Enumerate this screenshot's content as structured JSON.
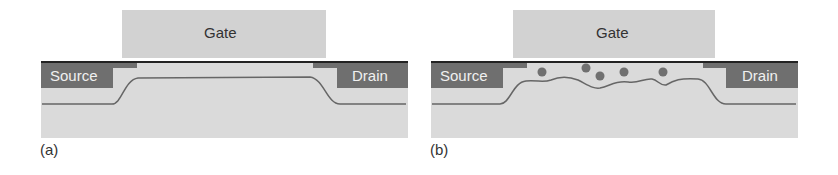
{
  "panels": [
    {
      "id": "a",
      "caption": "(a)",
      "gate": "Gate",
      "source": "Source",
      "drain": "Drain"
    },
    {
      "id": "b",
      "caption": "(b)",
      "gate": "Gate",
      "source": "Source",
      "drain": "Drain"
    }
  ],
  "colors": {
    "gate": "#d2d2d2",
    "substrate": "#d9d9d9",
    "contact": "#6f6f6f",
    "line": "#666666",
    "oxide": "#222222",
    "trap": "#707070"
  }
}
